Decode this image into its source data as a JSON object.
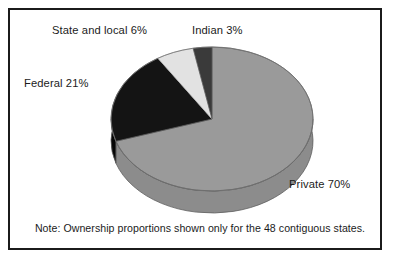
{
  "figure": {
    "note": "Note: Ownership proportions shown only for the 48 contiguous states.",
    "frame_color": "#1b1b1b",
    "background": "#ffffff"
  },
  "labels": {
    "state_and_local": "State and local 6%",
    "indian": "Indian 3%",
    "federal": "Federal 21%",
    "private": "Private 70%"
  },
  "chart_data": {
    "type": "pie",
    "title": "",
    "subtitle": "",
    "xlabel": "",
    "ylabel": "",
    "legend_position": "none",
    "grid": false,
    "three_d": true,
    "annotations": [
      "Note: Ownership proportions shown only for the 48 contiguous states."
    ],
    "categories": [
      "Private",
      "Federal",
      "State and local",
      "Indian"
    ],
    "values": [
      70,
      21,
      6,
      3
    ],
    "unit": "%",
    "labels": [
      "Private 70%",
      "Federal 21%",
      "State and local 6%",
      "Indian 3%"
    ],
    "colors": [
      "#9a9a9a",
      "#141414",
      "#e2e2e2",
      "#3a3a3a"
    ],
    "slices": [
      {
        "name": "Private",
        "value": 70,
        "label": "Private 70%",
        "color": "#9a9a9a"
      },
      {
        "name": "Federal",
        "value": 21,
        "label": "Federal 21%",
        "color": "#141414"
      },
      {
        "name": "State and local",
        "value": 6,
        "label": "State and local 6%",
        "color": "#e2e2e2"
      },
      {
        "name": "Indian",
        "value": 3,
        "label": "Indian 3%",
        "color": "#3a3a3a"
      }
    ]
  }
}
